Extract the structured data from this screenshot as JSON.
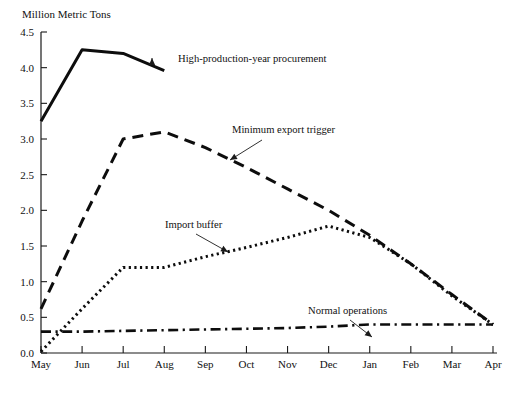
{
  "chart_data": {
    "type": "line",
    "title": "",
    "ylabel": "Million Metric Tons",
    "xlabel": "",
    "ylim": [
      0.0,
      4.5
    ],
    "yticks": [
      "0.0",
      "0.5",
      "1.0",
      "1.5",
      "2.0",
      "2.5",
      "3.0",
      "3.5",
      "4.0",
      "4.5"
    ],
    "ytick_values": [
      0.0,
      0.5,
      1.0,
      1.5,
      2.0,
      2.5,
      3.0,
      3.5,
      4.0,
      4.5
    ],
    "grid": false,
    "legend_position": "inline-annotations",
    "categories": [
      "May",
      "Jun",
      "Jul",
      "Aug",
      "Sep",
      "Oct",
      "Nov",
      "Dec",
      "Jan",
      "Feb",
      "Mar",
      "Apr"
    ],
    "series": [
      {
        "name": "High-production-year procurement",
        "style": "solid",
        "values": [
          3.25,
          4.25,
          4.2,
          3.96,
          null,
          null,
          null,
          null,
          null,
          null,
          null,
          null
        ]
      },
      {
        "name": "Minimum export trigger",
        "style": "dashed",
        "values": [
          0.62,
          1.85,
          3.0,
          3.1,
          2.88,
          2.6,
          2.3,
          2.0,
          1.65,
          1.25,
          0.82,
          0.4
        ]
      },
      {
        "name": "Import buffer",
        "style": "dotted",
        "values": [
          0.02,
          0.62,
          1.2,
          1.2,
          1.35,
          1.48,
          1.62,
          1.78,
          1.62,
          1.25,
          0.8,
          0.4
        ]
      },
      {
        "name": "Normal operations",
        "style": "dash-dot",
        "values": [
          0.3,
          0.3,
          0.31,
          0.32,
          0.33,
          0.34,
          0.35,
          0.37,
          0.4,
          0.4,
          0.4,
          0.4
        ]
      }
    ],
    "annotations": [
      {
        "label": "High-production-year procurement",
        "series": "High-production-year procurement",
        "text_x": 178,
        "text_y": 62,
        "point_x": 152,
        "point_y": 62,
        "arrow_x": 152,
        "arrow_y": 58
      },
      {
        "label": "Minimum export trigger",
        "series": "Minimum export trigger",
        "text_x": 232,
        "text_y": 133,
        "point_x": 262,
        "point_y": 140,
        "arrow_x": 230,
        "arrow_y": 160
      },
      {
        "label": "Import buffer",
        "series": "Import buffer",
        "text_x": 165,
        "text_y": 228,
        "point_x": 196,
        "point_y": 234,
        "arrow_x": 228,
        "arrow_y": 252
      },
      {
        "label": "Normal operations",
        "series": "Normal operations",
        "text_x": 308,
        "text_y": 314,
        "point_x": 350,
        "point_y": 320,
        "arrow_x": 372,
        "arrow_y": 337
      }
    ]
  },
  "axis": {
    "y_label_text": "Million Metric Tons"
  }
}
